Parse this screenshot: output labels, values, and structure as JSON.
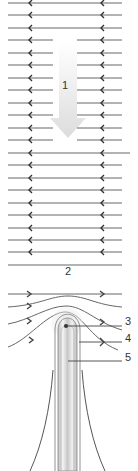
{
  "diagram": {
    "type": "electric-field-lines-around-charged-tip",
    "colors": {
      "field_line": "#666666",
      "arrow_fill": "#e6e6e6",
      "tip_glow": "#dddddd",
      "rod": "#cfcfcf",
      "label": "#333333"
    },
    "labels": [
      {
        "id": "1",
        "text": "1",
        "x": 64,
        "y": 82
      },
      {
        "id": "2",
        "text": "2",
        "x": 66,
        "y": 268
      },
      {
        "id": "3",
        "text": "3",
        "x": 125,
        "y": 318
      },
      {
        "id": "4",
        "text": "4",
        "x": 125,
        "y": 335
      },
      {
        "id": "5",
        "text": "5",
        "x": 125,
        "y": 353
      }
    ],
    "uniform_field": {
      "direction": "left",
      "line_y": [
        3,
        15,
        28,
        40,
        53,
        65,
        78,
        90,
        103,
        115,
        128,
        140,
        153,
        165,
        178,
        190,
        203,
        215,
        228,
        240,
        252
      ],
      "gap_rows": [
        3,
        4,
        5,
        6,
        7,
        8,
        9,
        10,
        11
      ],
      "arrow_x": [
        29,
        101
      ]
    },
    "lower_field": {
      "direction": "right",
      "plain_line_y": 265
    }
  }
}
